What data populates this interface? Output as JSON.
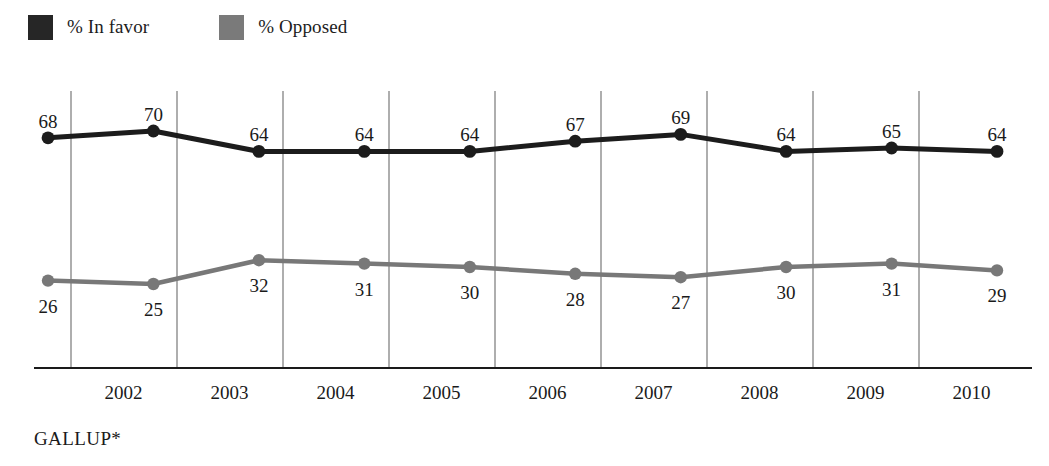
{
  "legend": {
    "position": "top-left",
    "items": [
      {
        "label": "% In favor",
        "color": "#262626",
        "swatch": "legend-swatch-in-favor"
      },
      {
        "label": "% Opposed",
        "color": "#7a7a7a",
        "swatch": "legend-swatch-opposed"
      }
    ]
  },
  "source": {
    "text": "GALLUP*"
  },
  "chart_data": {
    "type": "line",
    "title": "",
    "subtitle": "",
    "xlabel": "",
    "ylabel": "",
    "grid": true,
    "legend_position": "top-left",
    "categories": [
      "2002",
      "2003",
      "2004",
      "2005",
      "2006",
      "2007",
      "2008",
      "2009",
      "2010",
      "2011"
    ],
    "tick_labels": [
      "2002",
      "2003",
      "2004",
      "2005",
      "2006",
      "2007",
      "2008",
      "2009",
      "2010"
    ],
    "ylim": [
      0,
      100
    ],
    "series": [
      {
        "name": "% In favor",
        "color": "#1c1c1c",
        "values": [
          68,
          70,
          64,
          64,
          64,
          67,
          69,
          64,
          65,
          64
        ]
      },
      {
        "name": "% Opposed",
        "color": "#787878",
        "values": [
          26,
          25,
          32,
          31,
          30,
          28,
          27,
          30,
          31,
          29
        ]
      }
    ]
  }
}
